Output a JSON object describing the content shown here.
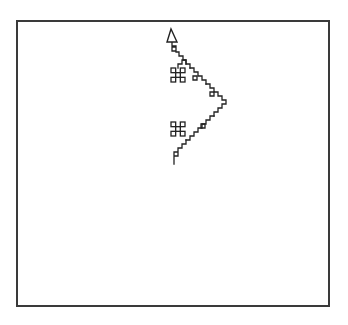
{
  "figure": {
    "type": "fractal-curve-plot",
    "background": "#ffffff",
    "frame": {
      "x": 17,
      "y": 21,
      "width": 312,
      "height": 285,
      "stroke": "#3a3a3a"
    },
    "ink": "#222222",
    "arrow": {
      "points": "171,29 167,42 177,42"
    },
    "curve_segments": [
      "172,42 172,46 176,46 176,51 172,51 172,47 176,47 176,52 179,52 179,56 183,56 183,60 186,60 186,64 190,64 190,68",
      "186,64 186,60 182,60 182,64 178,64 178,68",
      "190,68 194,68 194,72 198,72 198,76 202,76 202,80 206,80 206,84",
      "193,76 197,76 197,80 193,80 193,76",
      "206,84 210,84 210,88 214,88 214,92 218,92 218,96 222,96 222,100 226,100 226,104 222,104 222,108 218,108 218,112 214,112 214,116",
      "210,92 214,92 214,96 210,96 210,92",
      "214,116 210,116 210,120 206,120 206,124 202,124 202,128 198,128 198,132 194,132 194,136 190,136 190,140 186,140",
      "201,124 205,124 205,128 201,128 201,124",
      "186,140 186,144 182,144 182,148 178,148 178,152 174,152 174,156 178,156 178,152 174,152 174,160 174,164"
    ],
    "glyphs": [
      {
        "name": "upper-command-glyph",
        "x": 171,
        "y": 68,
        "size": 14
      },
      {
        "name": "lower-command-glyph",
        "x": 171,
        "y": 122,
        "size": 14
      }
    ]
  }
}
